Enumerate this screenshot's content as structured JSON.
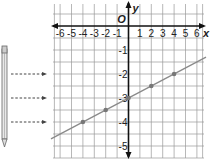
{
  "chart_data": {
    "type": "line",
    "title": "",
    "xlabel": "x",
    "ylabel": "y",
    "origin_label": "O",
    "x_ticks": [
      -6,
      -5,
      -4,
      -3,
      -2,
      -1,
      1,
      2,
      3,
      4,
      5,
      6
    ],
    "x_tick_labels": [
      "-6",
      "-5",
      "-4",
      "-3",
      "-2",
      "-1",
      "1",
      "2",
      "3",
      "4",
      "5",
      "6"
    ],
    "y_ticks": [
      -1,
      -2,
      -3,
      -4,
      -5
    ],
    "y_tick_labels": [
      "-1",
      "-2",
      "-3",
      "-4",
      "-5"
    ],
    "xlim": [
      -6.5,
      6.5
    ],
    "ylim": [
      -5.4,
      0.9
    ],
    "grid": true,
    "series": [
      {
        "name": "line",
        "equation": "y = 0.25x - 3",
        "slope": 0.25,
        "intercept": -3,
        "points": [
          {
            "x": -4,
            "y": -4
          },
          {
            "x": -2,
            "y": -3.5
          },
          {
            "x": 0,
            "y": -3
          },
          {
            "x": 2,
            "y": -2.5
          },
          {
            "x": 4,
            "y": -2
          }
        ]
      }
    ],
    "annotations": {
      "pencil": "pencil illustration at left",
      "arrows_pointing_to_y": [
        -2,
        -3,
        -4
      ]
    }
  },
  "colors": {
    "axis": "#111111",
    "grid": "#9a9a9a",
    "line": "#8a8a8a",
    "point": "#777777",
    "arrow": "#444444"
  }
}
